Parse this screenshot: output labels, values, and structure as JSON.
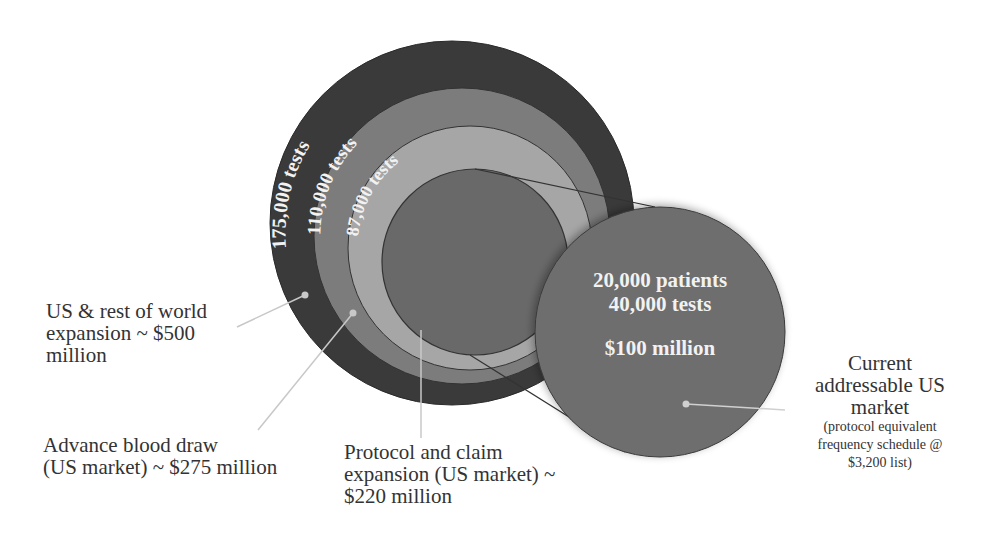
{
  "diagram": {
    "rings": [
      {
        "id": "us-rest-of-world",
        "label": "175,000 tests",
        "color": "#3a3a3a"
      },
      {
        "id": "advance-blood-draw",
        "label": "110,000 tests",
        "color": "#7c7c7c"
      },
      {
        "id": "protocol-claim",
        "label": "87,000 tests",
        "color": "#a6a6a6"
      },
      {
        "id": "current-core",
        "label": "",
        "color": "#696969"
      }
    ],
    "current_market_circle": {
      "color": "#6e6e6e",
      "line1": "20,000 patients",
      "line2": "40,000 tests",
      "line3": "$100 million"
    },
    "callouts": {
      "us_rest_of_world": [
        "US & rest of world",
        "expansion ~ $500",
        "million"
      ],
      "advance_blood_draw": [
        "Advance blood draw",
        "(US market) ~ $275 million"
      ],
      "protocol_claim": [
        "Protocol and claim",
        "expansion (US market) ~",
        "$220 million"
      ],
      "current_market": {
        "title": [
          "Current",
          "addressable US",
          "market"
        ],
        "note": [
          "(protocol equivalent",
          "frequency schedule @",
          "$3,200 list)"
        ]
      }
    }
  }
}
